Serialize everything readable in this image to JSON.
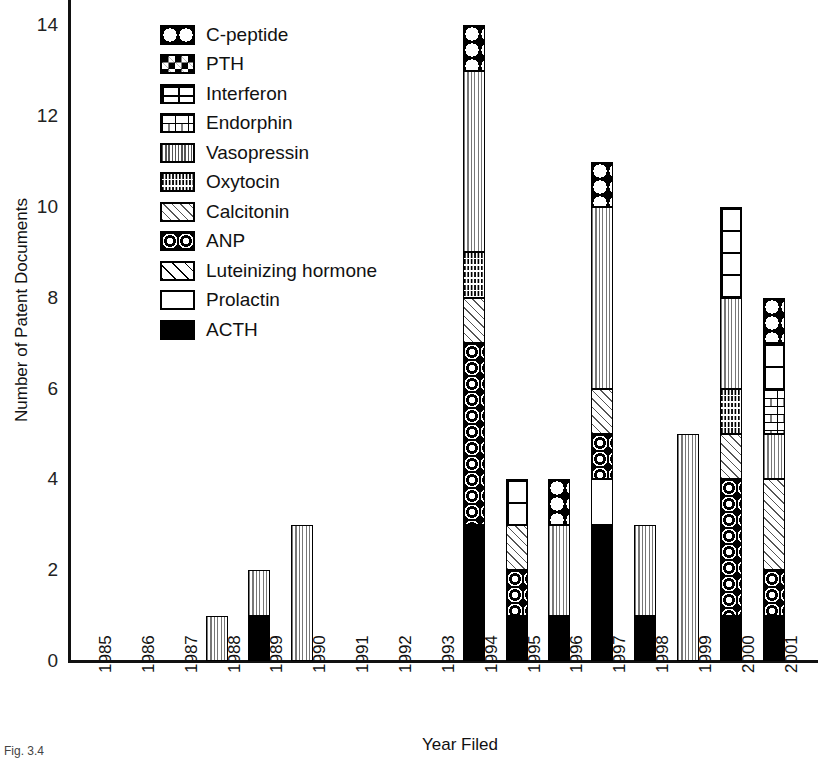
{
  "chart_data": {
    "type": "bar",
    "stacked": true,
    "title": "",
    "xlabel": "Year Filed",
    "ylabel": "Number of Patent Documents",
    "ylim": [
      0,
      15
    ],
    "ytick_labels": [
      "0",
      "2",
      "4",
      "6",
      "8",
      "10",
      "12",
      "14"
    ],
    "ytick_values": [
      0,
      2,
      4,
      6,
      8,
      10,
      12,
      14
    ],
    "grid": false,
    "legend_position": "upper-left-inside",
    "categories": [
      "1985",
      "1986",
      "1987",
      "1988",
      "1989",
      "1990",
      "1991",
      "1992",
      "1993",
      "1994",
      "1995",
      "1996",
      "1997",
      "1998",
      "1999",
      "2000",
      "2001"
    ],
    "series": [
      {
        "name": "C-peptide",
        "pattern": "cpeptide",
        "values": [
          0,
          0,
          0,
          0,
          0,
          0,
          0,
          0,
          0,
          1,
          0,
          1,
          1,
          0,
          0,
          0,
          1
        ]
      },
      {
        "name": "PTH",
        "pattern": "pth",
        "values": [
          0,
          0,
          0,
          0,
          0,
          0,
          0,
          0,
          0,
          0,
          0,
          0,
          0,
          0,
          0,
          0,
          0
        ]
      },
      {
        "name": "Interferon",
        "pattern": "interferon",
        "values": [
          0,
          0,
          0,
          0,
          0,
          0,
          0,
          0,
          0,
          0,
          1,
          0,
          0,
          0,
          0,
          2,
          1
        ]
      },
      {
        "name": "Endorphin",
        "pattern": "endorphin",
        "values": [
          0,
          0,
          0,
          0,
          0,
          0,
          0,
          0,
          0,
          0,
          0,
          0,
          0,
          0,
          0,
          0,
          1
        ]
      },
      {
        "name": "Vasopressin",
        "pattern": "vasopressin",
        "values": [
          0,
          0,
          0,
          1,
          1,
          3,
          0,
          0,
          0,
          4,
          0,
          2,
          4,
          2,
          5,
          2,
          1
        ]
      },
      {
        "name": "Oxytocin",
        "pattern": "oxytocin",
        "values": [
          0,
          0,
          0,
          0,
          0,
          0,
          0,
          0,
          0,
          1,
          0,
          0,
          0,
          0,
          0,
          1,
          0
        ]
      },
      {
        "name": "Calcitonin",
        "pattern": "calcitonin",
        "values": [
          0,
          0,
          0,
          0,
          0,
          0,
          0,
          0,
          0,
          1,
          1,
          0,
          1,
          0,
          0,
          1,
          2
        ]
      },
      {
        "name": "ANP",
        "pattern": "anp",
        "values": [
          0,
          0,
          0,
          0,
          0,
          0,
          0,
          0,
          0,
          4,
          1,
          0,
          1,
          0,
          0,
          3,
          1
        ]
      },
      {
        "name": "Luteinizing hormone",
        "pattern": "lh",
        "values": [
          0,
          0,
          0,
          0,
          0,
          0,
          0,
          0,
          0,
          0,
          0,
          0,
          0,
          0,
          0,
          0,
          0
        ]
      },
      {
        "name": "Prolactin",
        "pattern": "prolactin",
        "values": [
          0,
          0,
          0,
          0,
          0,
          0,
          0,
          0,
          0,
          0,
          0,
          0,
          1,
          0,
          0,
          0,
          0
        ]
      },
      {
        "name": "ACTH",
        "pattern": "acth",
        "values": [
          0,
          0,
          0,
          0,
          1,
          0,
          0,
          0,
          0,
          3,
          1,
          1,
          3,
          1,
          0,
          1,
          1
        ]
      }
    ],
    "totals": [
      0,
      0,
      0,
      1,
      2,
      3,
      0,
      0,
      0,
      13,
      4,
      4,
      11,
      3,
      5,
      9,
      8
    ]
  },
  "legend": {
    "items": [
      {
        "label": "C-peptide",
        "pattern": "cpeptide"
      },
      {
        "label": "PTH",
        "pattern": "pth"
      },
      {
        "label": "Interferon",
        "pattern": "interferon"
      },
      {
        "label": "Endorphin",
        "pattern": "endorphin"
      },
      {
        "label": "Vasopressin",
        "pattern": "vasopressin"
      },
      {
        "label": "Oxytocin",
        "pattern": "oxytocin"
      },
      {
        "label": "Calcitonin",
        "pattern": "calcitonin"
      },
      {
        "label": "ANP",
        "pattern": "anp"
      },
      {
        "label": "Luteinizing hormone",
        "pattern": "lh"
      },
      {
        "label": "Prolactin",
        "pattern": "prolactin"
      },
      {
        "label": "ACTH",
        "pattern": "acth"
      }
    ]
  },
  "axes": {
    "y_title": "Number of Patent Documents",
    "x_title": "Year Filed"
  },
  "caption": "Fig. 3.4",
  "colors": {
    "ink": "#000000",
    "background": "#ffffff",
    "hatch_gray": "#777777"
  }
}
